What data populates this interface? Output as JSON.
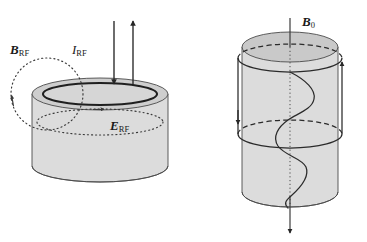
{
  "figure": {
    "background_color": "#ffffff",
    "width": 367,
    "height": 242,
    "stroke_color": "#262626",
    "fill_light": "#d9d9d9",
    "fill_mid": "#c4c4c4",
    "fill_dark": "#b3b3b3"
  },
  "labels": {
    "b_rf": {
      "symbol": "B",
      "subscript": "RF",
      "style": "bold-italic"
    },
    "i_rf": {
      "symbol": "I",
      "subscript": "RF",
      "style": "italic"
    },
    "e_rf": {
      "symbol": "E",
      "subscript": "RF",
      "style": "bold-italic"
    },
    "b_0": {
      "symbol": "B",
      "subscript": "0",
      "style": "bold-italic"
    }
  },
  "left_panel": {
    "name": "rf-resonator-disc",
    "description": "Short wide cylinder (disc) with annular top ring",
    "cylinder": {
      "cx": 100,
      "cy_top": 94,
      "rx": 68,
      "ry": 16,
      "height": 72
    },
    "inner_ring": {
      "rx": 56,
      "ry": 11
    },
    "current_arrows": [
      {
        "name": "current-arrow-down",
        "x": 114,
        "y_from": 22,
        "y_to": 82,
        "direction": "down"
      },
      {
        "name": "current-arrow-up",
        "x": 133,
        "y_from": 82,
        "y_to": 22,
        "direction": "up"
      }
    ],
    "b_rf_loop": {
      "cx": 46,
      "cy": 93,
      "r": 35,
      "style": "dotted",
      "arrow": "up-left"
    },
    "e_rf_loop": {
      "cx": 100,
      "cy": 122,
      "rx": 62,
      "ry": 13,
      "style": "dotted",
      "arrow": "right"
    }
  },
  "right_panel": {
    "name": "static-field-cylinder",
    "description": "Tall cylinder with axial B0 arrow, circulating loop and helical wave",
    "cylinder": {
      "cx": 290,
      "cy_top": 47,
      "rx": 48,
      "ry": 15,
      "height": 145
    },
    "b0_axis": {
      "x": 290,
      "y_from": 18,
      "y_to": 232,
      "direction": "down"
    },
    "field_loops": [
      {
        "name": "upper-field-loop",
        "cy": 57,
        "rx": 52,
        "ry": 14
      },
      {
        "name": "lower-field-loop",
        "cy": 133,
        "rx": 52,
        "ry": 14
      }
    ],
    "loop_arrows": [
      {
        "name": "loop-arrow-down-left",
        "x": 240,
        "y": 103,
        "direction": "down"
      },
      {
        "name": "loop-arrow-up-right",
        "x": 340,
        "y": 103,
        "direction": "up"
      }
    ],
    "helix": {
      "cx": 290,
      "y_from": 74,
      "y_to": 205,
      "amplitude": 26,
      "turns": 3
    }
  }
}
